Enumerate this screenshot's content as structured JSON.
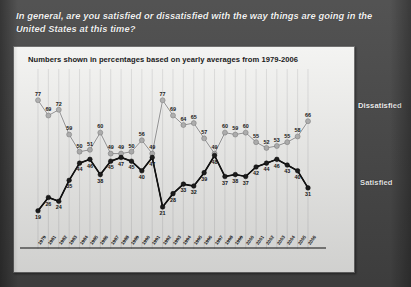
{
  "slide": {
    "question": "In general, are you satisfied or dissatisfied with the way things are going in the United States at this time?",
    "background_color": "#4a4a4a",
    "panel_background_color": "#fbfbf9"
  },
  "legend": {
    "dissatisfied_label": "Dissatisfied",
    "satisfied_label": "Satisfied",
    "dissatisfied_color": "#b9b9b9",
    "satisfied_color": "#1a1a1a"
  },
  "chart_data": {
    "type": "line",
    "title": "Numbers shown in percentages based on yearly averages from 1979-2006",
    "xlabel": "",
    "ylabel": "",
    "ylim": [
      0,
      85
    ],
    "grid": true,
    "legend_position": "right",
    "categories": [
      "1979",
      "1981",
      "1982",
      "1983",
      "1984",
      "1985",
      "1986",
      "1987",
      "1988",
      "1989",
      "1990",
      "1991",
      "1992",
      "1993",
      "1994",
      "1995",
      "1996",
      "1997",
      "1998",
      "1999",
      "2000",
      "2001",
      "2002",
      "2003",
      "2004",
      "2005",
      "2006"
    ],
    "series": [
      {
        "name": "Dissatisfied",
        "color": "#b9b9b9",
        "values": [
          77,
          69,
          72,
          59,
          50,
          51,
          60,
          49,
          49,
          50,
          56,
          49,
          77,
          69,
          64,
          65,
          57,
          49,
          60,
          59,
          60,
          55,
          52,
          53,
          55,
          58,
          66
        ]
      },
      {
        "name": "Satisfied",
        "color": "#1a1a1a",
        "values": [
          19,
          26,
          24,
          35,
          44,
          46,
          38,
          45,
          47,
          45,
          40,
          47,
          21,
          28,
          33,
          32,
          39,
          48,
          37,
          38,
          37,
          42,
          44,
          46,
          43,
          40,
          31
        ]
      }
    ]
  }
}
